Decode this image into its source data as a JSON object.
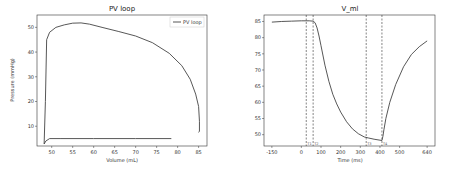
{
  "chart_data": [
    {
      "type": "line",
      "title": "PV loop",
      "xlabel": "Volume (mL)",
      "ylabel": "Pressure (mmHg)",
      "xlim": [
        46.5,
        87
      ],
      "ylim": [
        2,
        55
      ],
      "xticks": [
        50,
        55,
        60,
        65,
        70,
        75,
        80,
        85
      ],
      "yticks": [
        10,
        20,
        30,
        40,
        50
      ],
      "grid": false,
      "legend": {
        "position": "top-right",
        "entries": [
          "PV loop"
        ]
      },
      "series": [
        {
          "name": "PV loop",
          "x": [
            78.5,
            70,
            60,
            52,
            49.5,
            48.6,
            48.2,
            48.5,
            48.8,
            49.5,
            51,
            53,
            55,
            57,
            59,
            62,
            66,
            70,
            74,
            78,
            81,
            83,
            84.3,
            85,
            85.2,
            85.2,
            85.0
          ],
          "y": [
            5.0,
            5.0,
            5.0,
            5.0,
            5.0,
            4.0,
            2.8,
            20,
            45,
            48,
            50,
            51,
            51.7,
            51.8,
            51.3,
            50,
            48.3,
            46.5,
            43.8,
            39.5,
            34.5,
            29,
            23,
            18,
            12,
            8,
            7.5
          ]
        }
      ]
    },
    {
      "type": "line",
      "title": "V_ml",
      "xlabel": "Time (ms)",
      "ylabel": "",
      "xlim": [
        -190,
        680
      ],
      "ylim": [
        46.5,
        87
      ],
      "xticks": [
        -150,
        0,
        100,
        200,
        300,
        400,
        500,
        640
      ],
      "yticks": [
        50,
        55,
        60,
        65,
        70,
        75,
        80,
        85
      ],
      "grid": false,
      "vlines": [
        {
          "x": 25,
          "style": "dashed",
          "label": "T1"
        },
        {
          "x": 60,
          "style": "dashed",
          "label": "T2"
        },
        {
          "x": 330,
          "style": "dashed",
          "label": "T3"
        },
        {
          "x": 410,
          "style": "dashed",
          "label": "T4"
        }
      ],
      "series": [
        {
          "name": "V_ml",
          "x": [
            -150,
            -100,
            -50,
            0,
            40,
            60,
            70,
            80,
            90,
            100,
            120,
            140,
            160,
            180,
            200,
            230,
            260,
            290,
            320,
            340,
            370,
            400,
            410,
            415,
            420,
            430,
            450,
            480,
            520,
            560,
            600,
            640
          ],
          "y": [
            84.8,
            85.0,
            85.1,
            85.2,
            85.2,
            85.1,
            84.6,
            83.0,
            80.5,
            77.5,
            71.5,
            66.5,
            62.5,
            59.5,
            57.0,
            54.0,
            51.8,
            50.3,
            49.3,
            49.0,
            48.6,
            48.3,
            48.2,
            49.5,
            51.5,
            55,
            60,
            65.5,
            71,
            74.8,
            77.2,
            79.0
          ]
        }
      ]
    }
  ]
}
